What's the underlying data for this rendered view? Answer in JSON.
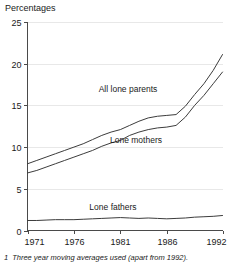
{
  "figure": {
    "axis_title": "Percentages",
    "footnote_number": "1",
    "footnote_text": "Three year moving averages used (apart from 1992)."
  },
  "chart_data": {
    "type": "line",
    "title": "Percentages",
    "xlabel": "",
    "ylabel": "Percentages",
    "xlim": [
      1971,
      1992
    ],
    "ylim": [
      0,
      25
    ],
    "yticks": [
      0,
      5,
      10,
      15,
      20,
      25
    ],
    "xticks": [
      1971,
      1976,
      1981,
      1986,
      1992
    ],
    "grid": false,
    "legend_position": "inline-annotations",
    "line_color": "#3c3c3c",
    "x": [
      1971,
      1972,
      1973,
      1974,
      1975,
      1976,
      1977,
      1978,
      1979,
      1980,
      1981,
      1982,
      1983,
      1984,
      1985,
      1986,
      1987,
      1988,
      1989,
      1990,
      1991,
      1992
    ],
    "series": [
      {
        "name": "All lone parents",
        "values": [
          8.0,
          8.4,
          8.8,
          9.2,
          9.6,
          10.0,
          10.4,
          10.9,
          11.4,
          11.8,
          12.1,
          12.6,
          13.1,
          13.5,
          13.7,
          13.8,
          13.9,
          14.9,
          16.3,
          17.6,
          19.2,
          21.1
        ]
      },
      {
        "name": "Lone mothers",
        "values": [
          6.9,
          7.2,
          7.6,
          8.0,
          8.4,
          8.8,
          9.2,
          9.6,
          10.1,
          10.5,
          10.8,
          11.4,
          11.8,
          12.1,
          12.3,
          12.4,
          12.6,
          13.6,
          15.0,
          16.2,
          17.6,
          19.0
        ]
      },
      {
        "name": "Lone fathers",
        "values": [
          1.2,
          1.2,
          1.25,
          1.3,
          1.3,
          1.3,
          1.35,
          1.4,
          1.45,
          1.5,
          1.55,
          1.5,
          1.45,
          1.5,
          1.45,
          1.4,
          1.45,
          1.5,
          1.6,
          1.65,
          1.7,
          1.8
        ]
      }
    ],
    "annotations": [
      {
        "text": "All lone parents",
        "x_px": 128,
        "y_px": 92
      },
      {
        "text": "Lone mothers",
        "x_px": 136,
        "y_px": 143
      },
      {
        "text": "Lone fathers",
        "x_px": 113,
        "y_px": 210
      }
    ]
  }
}
